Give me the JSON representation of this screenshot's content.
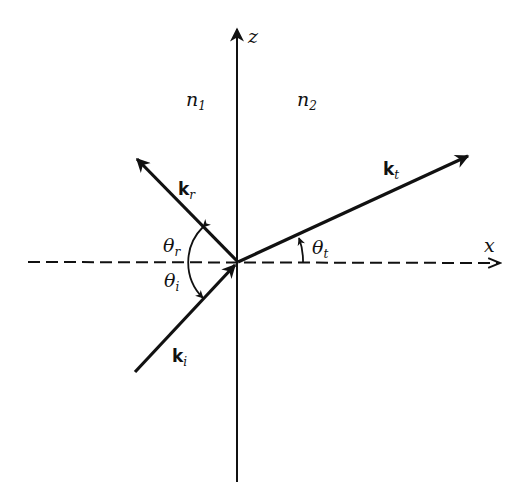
{
  "diagram": {
    "type": "refraction-geometry",
    "origin": {
      "x": 238,
      "y": 262
    },
    "axes": {
      "z": {
        "label": "z",
        "style": "solid",
        "from": [
          237,
          482
        ],
        "to": [
          237,
          27
        ]
      },
      "x": {
        "label": "x",
        "style": "dashed",
        "from": [
          28,
          262
        ],
        "to": [
          501,
          263
        ]
      }
    },
    "media": [
      {
        "label": "n",
        "sub": "1"
      },
      {
        "label": "n",
        "sub": "2"
      }
    ],
    "vectors": {
      "incident": {
        "label": "k",
        "sub": "i",
        "from": [
          135,
          372
        ],
        "to": [
          238,
          262
        ]
      },
      "reflected": {
        "label": "k",
        "sub": "r",
        "from": [
          238,
          262
        ],
        "to": [
          135,
          157
        ]
      },
      "transmitted": {
        "label": "k",
        "sub": "t",
        "from": [
          238,
          262
        ],
        "to": [
          470,
          155
        ]
      }
    },
    "angles": {
      "reflected": {
        "symbol": "θ",
        "sub": "r"
      },
      "incident": {
        "symbol": "θ",
        "sub": "i"
      },
      "transmitted": {
        "symbol": "θ",
        "sub": "t"
      }
    },
    "colors": {
      "ink": "#111111",
      "background": "#ffffff"
    }
  }
}
